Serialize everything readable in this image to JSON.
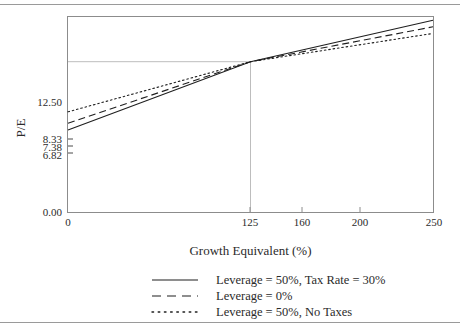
{
  "chart_data": {
    "type": "line",
    "title": "",
    "xlabel": "Growth Equivalent (%)",
    "ylabel": "P/E",
    "xlim": [
      0,
      250
    ],
    "ylim": [
      0,
      16.3
    ],
    "xticks": [
      0,
      125,
      160,
      200,
      250
    ],
    "xticklabels": [
      "0",
      "125",
      "160",
      "200",
      "250"
    ],
    "yticks": [
      0.0,
      6.82,
      7.38,
      8.33,
      12.5
    ],
    "yticklabels": [
      "0.00",
      "6.82",
      "7.38",
      "8.33",
      "12.50"
    ],
    "grid": false,
    "reference_lines": {
      "horizontal_y": 12.5,
      "vertical_x": 125
    },
    "legend_position": "below",
    "series": [
      {
        "name": "Leverage = 50%, Tax Rate = 30%",
        "style": "solid",
        "x": [
          0,
          125,
          250
        ],
        "y": [
          6.82,
          12.5,
          15.95
        ]
      },
      {
        "name": "Leverage = 0%",
        "style": "dashed",
        "x": [
          0,
          125,
          250
        ],
        "y": [
          7.38,
          12.5,
          15.4
        ]
      },
      {
        "name": "Leverage = 50%, No Taxes",
        "style": "dotted",
        "x": [
          0,
          125,
          250
        ],
        "y": [
          8.33,
          12.5,
          14.85
        ]
      }
    ]
  },
  "axis": {
    "ylabel": "P/E",
    "xlabel": "Growth Equivalent (%)",
    "yticklabels": [
      "12.50",
      "8.33",
      "7.38",
      "6.82",
      "0.00"
    ],
    "xticklabels": [
      "0",
      "125",
      "160",
      "200",
      "250"
    ]
  },
  "legend": {
    "items": [
      {
        "label": "Leverage = 50%, Tax Rate = 30%",
        "style": "solid"
      },
      {
        "label": "Leverage = 0%",
        "style": "dashed"
      },
      {
        "label": "Leverage = 50%, No Taxes",
        "style": "dotted"
      }
    ]
  },
  "colors": {
    "line": "#1f1f1f",
    "frame": "#8c8c8c",
    "guide": "#b9b9b9",
    "rule": "#9a9a9a",
    "text": "#2b2b2b"
  }
}
